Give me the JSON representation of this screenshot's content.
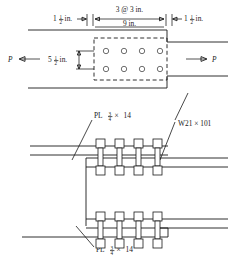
{
  "figure": {
    "line_color": "#1a1a1a",
    "background": "#ffffff"
  },
  "dimensions": {
    "edge_left": {
      "whole": "1",
      "num": "1",
      "den": "2",
      "unit": "in."
    },
    "spacing_top": "3 @ 3 in.",
    "spacing_total": "9 in.",
    "edge_right": {
      "whole": "1",
      "num": "1",
      "den": "2",
      "unit": "in."
    },
    "gage_vertical": {
      "whole": "5",
      "num": "1",
      "den": "2",
      "unit": "in."
    }
  },
  "loads": {
    "left": "P",
    "right": "P"
  },
  "callouts": {
    "plate_top": {
      "prefix": "PL",
      "num": "3",
      "den": "4",
      "times": "×",
      "width": "14"
    },
    "plate_bottom": {
      "prefix": "PL",
      "num": "3",
      "den": "4",
      "times": "×",
      "width": "14"
    },
    "beam": "W21 × 101"
  },
  "bolt_pattern": {
    "columns": 4,
    "rows": 2,
    "hole_radius": 2.6,
    "plan_holes_x": [
      106,
      124,
      142,
      160
    ],
    "plan_holes_y": [
      55,
      73
    ]
  },
  "side_view": {
    "upper_bolts_x": [
      100,
      119,
      138,
      157
    ],
    "lower_bolts_x": [
      100,
      119,
      138,
      157
    ],
    "bolt_count_per_row": 4
  }
}
